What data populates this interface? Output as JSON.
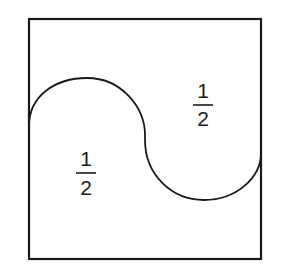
{
  "diagram": {
    "stroke_color": "#1a1a1a",
    "background": "#ffffff",
    "regions": [
      {
        "name": "lower-left-region",
        "label_numerator": "1",
        "label_denominator": "2"
      },
      {
        "name": "upper-right-region",
        "label_numerator": "1",
        "label_denominator": "2"
      }
    ]
  }
}
